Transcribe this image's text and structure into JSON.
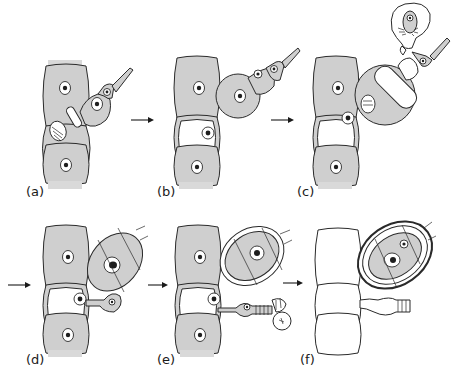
{
  "figure": {
    "panels": [
      {
        "id": "a",
        "label": "(a)"
      },
      {
        "id": "b",
        "label": "(b)"
      },
      {
        "id": "c",
        "label": "(c)"
      },
      {
        "id": "d",
        "label": "(d)"
      },
      {
        "id": "e",
        "label": "(e)"
      },
      {
        "id": "f",
        "label": "(f)"
      }
    ],
    "arrows": [
      {
        "from": "a",
        "to": "b"
      },
      {
        "from": "b",
        "to": "c"
      },
      {
        "from": "c",
        "to": "d"
      },
      {
        "from": "d",
        "to": "e"
      },
      {
        "from": "e",
        "to": "f"
      }
    ],
    "colors": {
      "cell_fill": "#cfcfcf",
      "outline": "#2a2a2a",
      "background": "#ffffff"
    }
  }
}
